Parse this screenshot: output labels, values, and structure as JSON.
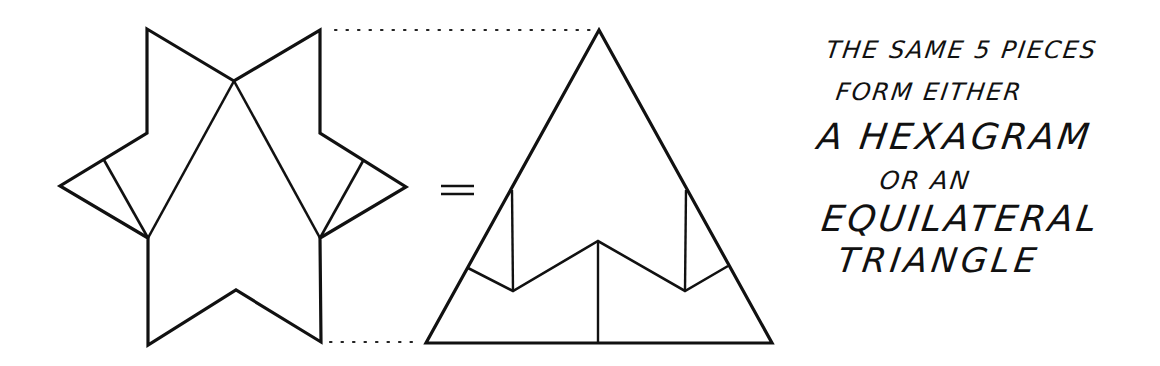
{
  "figure": {
    "equals_symbol": "=",
    "pieces_count": 5,
    "shapes": [
      {
        "name": "hexagram",
        "pieces": 5
      },
      {
        "name": "equilateral-triangle",
        "pieces": 5
      }
    ],
    "line_color": "#111111",
    "background_color": "#ffffff"
  },
  "caption": {
    "lines": [
      "THE SAME 5 PIECES",
      "FORM EITHER",
      "A HEXAGRAM",
      "OR AN",
      "EQUILATERAL",
      "TRIANGLE"
    ]
  }
}
